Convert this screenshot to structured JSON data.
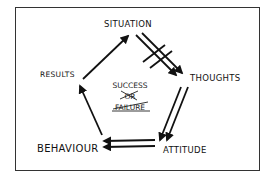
{
  "diagram": {
    "type": "cycle",
    "nodes": [
      {
        "id": "situation",
        "label": "SITUATION"
      },
      {
        "id": "thoughts",
        "label": "THOUGHTS"
      },
      {
        "id": "attitude",
        "label": "ATTITUDE"
      },
      {
        "id": "behaviour",
        "label": "BEHAVIOUR"
      },
      {
        "id": "results",
        "label": "RESULTS"
      }
    ],
    "edges": [
      {
        "from": "situation",
        "to": "thoughts",
        "style": "double-arrow-blocked",
        "note": "crossed by hatch marks"
      },
      {
        "from": "thoughts",
        "to": "attitude",
        "style": "double-arrow"
      },
      {
        "from": "attitude",
        "to": "behaviour",
        "style": "double-arrow"
      },
      {
        "from": "behaviour",
        "to": "results",
        "style": "single-arrow"
      },
      {
        "from": "results",
        "to": "situation",
        "style": "single-arrow"
      }
    ],
    "center": {
      "line1": "SUCCESS",
      "line2": "OR",
      "line3": "FAILURE",
      "crossed_out": [
        "OR",
        "FAILURE"
      ]
    },
    "colors": {
      "ink": "#111111",
      "frame": "#333333",
      "background": "#ffffff"
    }
  }
}
